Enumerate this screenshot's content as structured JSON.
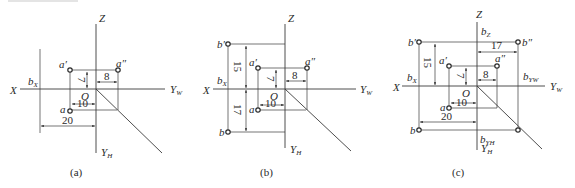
{
  "figure": {
    "panels": [
      {
        "id": "a",
        "caption": "(a)",
        "axes": {
          "x": "X",
          "z": "Z",
          "yw": "Y",
          "yw_sub": "W",
          "yh": "Y",
          "yh_sub": "H",
          "origin": "O"
        },
        "points": [
          {
            "name": "a'",
            "label": "a",
            "mark": "′"
          },
          {
            "name": "a\"",
            "label": "a",
            "mark": "″"
          },
          {
            "name": "a",
            "label": "a",
            "mark": ""
          }
        ],
        "guide_labels": [
          {
            "text": "b",
            "sub": "X"
          }
        ],
        "dimensions": [
          "7",
          "8",
          "10",
          "20"
        ]
      },
      {
        "id": "b",
        "caption": "(b)",
        "axes": {
          "x": "X",
          "z": "Z",
          "yw": "Y",
          "yw_sub": "W",
          "yh": "Y",
          "yh_sub": "H",
          "origin": "O"
        },
        "points": [
          {
            "name": "b'",
            "label": "b",
            "mark": "′"
          },
          {
            "name": "a'",
            "label": "a",
            "mark": "′"
          },
          {
            "name": "a\"",
            "label": "a",
            "mark": "″"
          },
          {
            "name": "a",
            "label": "a",
            "mark": ""
          },
          {
            "name": "b",
            "label": "b",
            "mark": ""
          }
        ],
        "guide_labels": [
          {
            "text": "b",
            "sub": "X"
          }
        ],
        "dimensions": [
          "15",
          "7",
          "8",
          "17",
          "10"
        ]
      },
      {
        "id": "c",
        "caption": "(c)",
        "axes": {
          "x": "X",
          "z": "Z",
          "yw": "Y",
          "yw_sub": "W",
          "yh": "Y",
          "yh_sub": "H",
          "origin": "O"
        },
        "points": [
          {
            "name": "b'",
            "label": "b",
            "mark": "′"
          },
          {
            "name": "b\"",
            "label": "b",
            "mark": "″"
          },
          {
            "name": "a'",
            "label": "a",
            "mark": "′"
          },
          {
            "name": "a\"",
            "label": "a",
            "mark": "″"
          },
          {
            "name": "a",
            "label": "a",
            "mark": ""
          },
          {
            "name": "b",
            "label": "b",
            "mark": ""
          }
        ],
        "guide_labels": [
          {
            "text": "b",
            "sub": "Z"
          },
          {
            "text": "b",
            "sub": "X"
          },
          {
            "text": "b",
            "sub": "YW"
          },
          {
            "text": "b",
            "sub": "YH"
          }
        ],
        "dimensions": [
          "17",
          "15",
          "7",
          "8",
          "10",
          "20"
        ]
      }
    ]
  }
}
